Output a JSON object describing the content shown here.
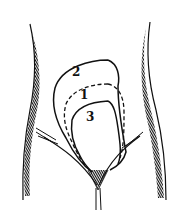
{
  "diagram": {
    "type": "anatomical line drawing",
    "colors": {
      "background": "#ffffff",
      "ink": "#111111"
    },
    "labels": [
      {
        "id": "label-2",
        "text": "2",
        "x": 72,
        "y": 76
      },
      {
        "id": "label-1",
        "text": "1",
        "x": 80,
        "y": 99
      },
      {
        "id": "label-3",
        "text": "3",
        "x": 86,
        "y": 121
      }
    ],
    "outlines": [
      {
        "label": "2",
        "style": "solid"
      },
      {
        "label": "1",
        "style": "dashed"
      },
      {
        "label": "3",
        "style": "solid"
      }
    ]
  }
}
